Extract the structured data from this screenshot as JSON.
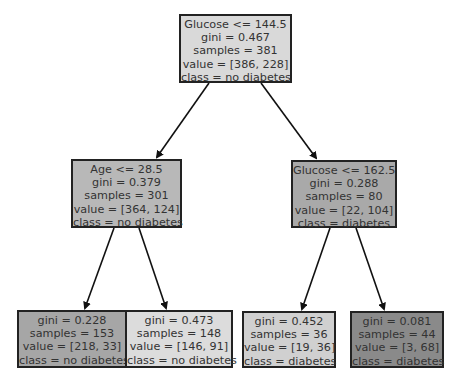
{
  "tree": {
    "nodes": [
      {
        "id": "root",
        "lines": [
          "Glucose <= 144.5",
          "gini = 0.467",
          "samples = 381",
          "value = [386, 228]",
          "class = no diabetes"
        ],
        "fill": "#d9d9d9"
      },
      {
        "id": "age",
        "lines": [
          "Age <= 28.5",
          "gini = 0.379",
          "samples = 301",
          "value = [364, 124]",
          "class = no diabetes"
        ],
        "fill": "#b8b8b8"
      },
      {
        "id": "glucose2",
        "lines": [
          "Glucose <= 162.5",
          "gini = 0.288",
          "samples = 80",
          "value = [22, 104]",
          "class = diabetes"
        ],
        "fill": "#a9a9a9"
      },
      {
        "id": "leaf1",
        "lines": [
          "gini = 0.228",
          "samples = 153",
          "value = [218, 33]",
          "class = no diabetes"
        ],
        "fill": "#a6a6a6"
      },
      {
        "id": "leaf2",
        "lines": [
          "gini = 0.473",
          "samples = 148",
          "value = [146, 91]",
          "class = no diabetes"
        ],
        "fill": "#dcdcdc"
      },
      {
        "id": "leaf3",
        "lines": [
          "gini = 0.452",
          "samples = 36",
          "value = [19, 36]",
          "class = diabetes"
        ],
        "fill": "#d0d0d0"
      },
      {
        "id": "leaf4",
        "lines": [
          "gini = 0.081",
          "samples = 44",
          "value = [3, 68]",
          "class = diabetes"
        ],
        "fill": "#8a8a8a"
      }
    ],
    "edges": [
      {
        "from": "root",
        "to": "age"
      },
      {
        "from": "root",
        "to": "glucose2"
      },
      {
        "from": "age",
        "to": "leaf1"
      },
      {
        "from": "age",
        "to": "leaf2"
      },
      {
        "from": "glucose2",
        "to": "leaf3"
      },
      {
        "from": "glucose2",
        "to": "leaf4"
      }
    ]
  }
}
